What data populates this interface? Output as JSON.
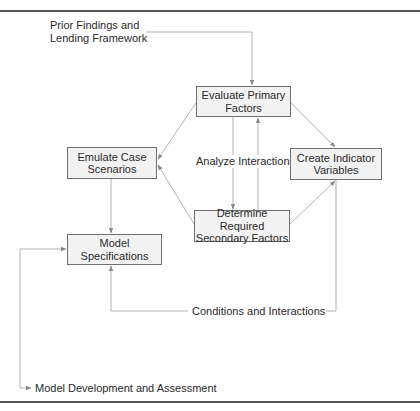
{
  "diagram": {
    "nodes": {
      "evaluate": {
        "label": "Evaluate Primary\nFactors",
        "line1": "Evaluate Primary",
        "line2": "Factors"
      },
      "emulate": {
        "line1": "Emulate Case",
        "line2": "Scenarios"
      },
      "indicator": {
        "line1": "Create Indicator",
        "line2": "Variables"
      },
      "secondary": {
        "line1": "Determine Required",
        "line2": "Secondary Factors"
      },
      "model_spec": {
        "line1": "Model Specifications"
      }
    },
    "labels": {
      "prior_line1": "Prior Findings and",
      "prior_line2": "Lending Framework",
      "analyze": "Analyze Interactions",
      "conditions": "Conditions and Interactions",
      "development": "Model Development and Assessment"
    },
    "edges": [
      {
        "from": "Prior Findings and Lending Framework",
        "to": "Evaluate Primary Factors"
      },
      {
        "from": "Evaluate Primary Factors",
        "to": "Emulate Case Scenarios"
      },
      {
        "from": "Evaluate Primary Factors",
        "to": "Create Indicator Variables"
      },
      {
        "from": "Evaluate Primary Factors",
        "to": "Determine Required Secondary Factors",
        "label": "Analyze Interactions"
      },
      {
        "from": "Determine Required Secondary Factors",
        "to": "Evaluate Primary Factors"
      },
      {
        "from": "Determine Required Secondary Factors",
        "to": "Emulate Case Scenarios"
      },
      {
        "from": "Determine Required Secondary Factors",
        "to": "Create Indicator Variables"
      },
      {
        "from": "Emulate Case Scenarios",
        "to": "Model Specifications"
      },
      {
        "from": "Create Indicator Variables",
        "to": "Model Specifications",
        "label": "Conditions and Interactions"
      },
      {
        "from": "Model Development and Assessment loop",
        "to": "Model Specifications"
      },
      {
        "from": "Model Specifications loop",
        "to": "Model Development and Assessment"
      }
    ],
    "colors": {
      "box_fill": "#f2f2f2",
      "box_border": "#6f6f6f",
      "wire": "#a8a8a8",
      "rule": "#555555"
    }
  }
}
